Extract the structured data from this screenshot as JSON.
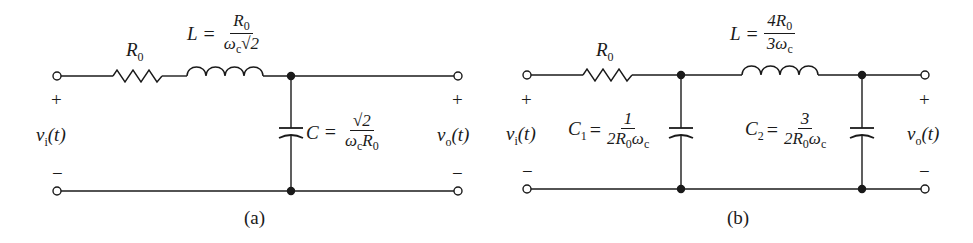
{
  "circuit_a": {
    "caption": "(a)",
    "resistor_label": "R",
    "resistor_sub": "0",
    "inductor_label": "L",
    "inductor_num": "R0",
    "inductor_den": "ωc√2",
    "capacitor_label": "C",
    "capacitor_num": "√2",
    "capacitor_den": "ωcR0",
    "input_plus": "+",
    "input_minus": "−",
    "input_voltage": "v",
    "input_sub": "i",
    "input_arg": "(t)",
    "output_plus": "+",
    "output_minus": "−",
    "output_voltage": "v",
    "output_sub": "o",
    "output_arg": "(t)",
    "equals": "="
  },
  "circuit_b": {
    "caption": "(b)",
    "resistor_label": "R",
    "resistor_sub": "0",
    "inductor_label": "L",
    "inductor_num": "4R0",
    "inductor_den": "3ωc",
    "c1_label": "C",
    "c1_sub": "1",
    "c1_num": "1",
    "c1_den": "2R0ωc",
    "c2_label": "C",
    "c2_sub": "2",
    "c2_num": "3",
    "c2_den": "2R0ωc",
    "input_plus": "+",
    "input_minus": "−",
    "input_voltage": "v",
    "input_sub": "i",
    "input_arg": "(t)",
    "output_plus": "+",
    "output_minus": "−",
    "output_voltage": "v",
    "output_sub": "o",
    "output_arg": "(t)",
    "equals": "="
  }
}
